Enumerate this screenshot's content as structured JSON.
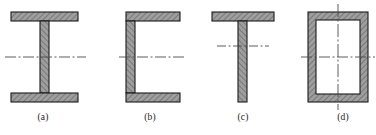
{
  "figure": {
    "background_color": "#ffffff",
    "outline_color": "#1a1a1a",
    "hatch_fill_color": "#9a9a9a",
    "hatch_line_color": "#555555",
    "centerline_color": "#4a4a4a",
    "interior_color": "#ffffff"
  },
  "captions": {
    "a": "(a)",
    "b": "(b)",
    "c": "(c)",
    "d": "(d)"
  },
  "sections": [
    {
      "id": "a",
      "name": "i-beam-section",
      "shape": "I-beam (wide flange)",
      "label": "(a)",
      "bounds": {
        "x": 11,
        "y": 12,
        "width": 67,
        "height": 90
      },
      "flange_thickness": 9,
      "web_thickness": 9,
      "centerlines": [
        "horizontal"
      ],
      "centerline_y": 57
    },
    {
      "id": "b",
      "name": "channel-section",
      "shape": "Channel (C-section), opening right",
      "label": "(b)",
      "bounds": {
        "x": 126,
        "y": 12,
        "width": 54,
        "height": 90
      },
      "flange_thickness": 9,
      "web_thickness": 9,
      "centerlines": [
        "horizontal"
      ],
      "centerline_y": 57
    },
    {
      "id": "c",
      "name": "tee-section",
      "shape": "T-section",
      "label": "(c)",
      "bounds": {
        "x": 212,
        "y": 12,
        "width": 62,
        "height": 90
      },
      "flange_thickness": 9,
      "web_thickness": 9,
      "centerlines": [
        "horizontal"
      ],
      "centerline_y": 46
    },
    {
      "id": "d",
      "name": "box-tube-section",
      "shape": "Rectangular hollow box tube",
      "label": "(d)",
      "bounds": {
        "x": 308,
        "y": 12,
        "width": 60,
        "height": 90
      },
      "wall_thickness": 8,
      "centerlines": [
        "horizontal",
        "vertical"
      ],
      "centerline_y": 57,
      "centerline_x": 338
    }
  ]
}
